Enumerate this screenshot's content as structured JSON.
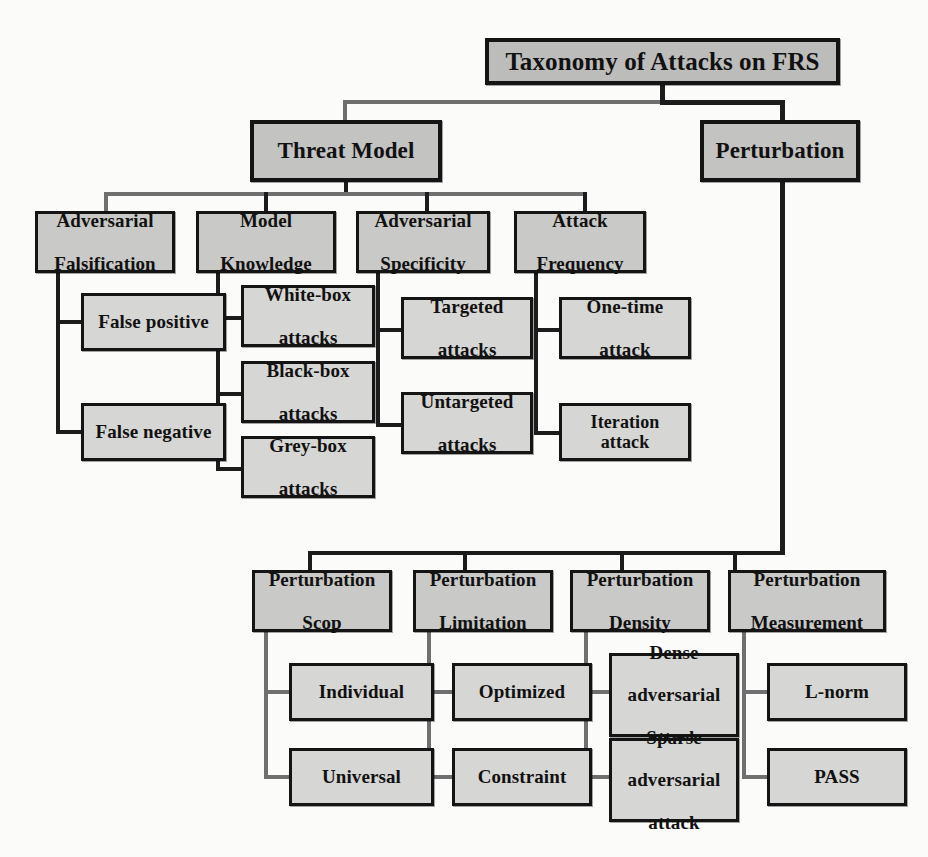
{
  "diagram": {
    "title": "Taxonomy of Attacks on FRS",
    "root": {
      "label": "Taxonomy of Attacks on FRS"
    },
    "branches": [
      {
        "label": "Threat Model",
        "categories": [
          {
            "label": "Adversarial Falsification",
            "line1": "Adversarial",
            "line2": "Falsification",
            "items": [
              {
                "label": "False positive"
              },
              {
                "label": "False negative"
              }
            ]
          },
          {
            "label": "Model Knowledge",
            "line1": "Model",
            "line2": "Knowledge",
            "items": [
              {
                "label": "White-box attacks",
                "line1": "White-box",
                "line2": "attacks"
              },
              {
                "label": "Black-box attacks",
                "line1": "Black-box",
                "line2": "attacks"
              },
              {
                "label": "Grey-box attacks",
                "line1": "Grey-box",
                "line2": "attacks"
              }
            ]
          },
          {
            "label": "Adversarial Specificity",
            "line1": "Adversarial",
            "line2": "Specificity",
            "items": [
              {
                "label": "Targeted attacks",
                "line1": "Targeted",
                "line2": "attacks"
              },
              {
                "label": "Untargeted attacks",
                "line1": "Untargeted",
                "line2": "attacks"
              }
            ]
          },
          {
            "label": "Attack Frequency",
            "line1": "Attack",
            "line2": "Frequency",
            "items": [
              {
                "label": "One-time attack",
                "line1": "One-time",
                "line2": "attack"
              },
              {
                "label": "Iteration attack",
                "line1": "Iteration attack",
                "line2": ""
              }
            ]
          }
        ]
      },
      {
        "label": "Perturbation",
        "categories": [
          {
            "label": "Perturbation Scop",
            "line1": "Perturbation",
            "line2": "Scop",
            "items": [
              {
                "label": "Individual"
              },
              {
                "label": "Universal"
              }
            ]
          },
          {
            "label": "Perturbation Limitation",
            "line1": "Perturbation",
            "line2": "Limitation",
            "items": [
              {
                "label": "Optimized"
              },
              {
                "label": "Constraint"
              }
            ]
          },
          {
            "label": "Perturbation Density",
            "line1": "Perturbation",
            "line2": "Density",
            "items": [
              {
                "label": "Dense adversarial attack",
                "line1": "Dense",
                "line2": "adversarial",
                "line3": "attack"
              },
              {
                "label": "Sparse adversarial attack",
                "line1": "Sparse",
                "line2": "adversarial",
                "line3": "attack"
              }
            ]
          },
          {
            "label": "Perturbation Measurement",
            "line1": "Perturbation",
            "line2": "Measurement",
            "items": [
              {
                "label": "L-norm"
              },
              {
                "label": "PASS"
              }
            ]
          }
        ]
      }
    ],
    "colors": {
      "box_fill_level0": "#bcbcba",
      "box_fill_level1": "#c3c3c1",
      "box_fill_level2": "#c9c9c7",
      "box_fill_level3": "#d6d6d4",
      "box_border": "#141414",
      "connector": "#6f6f6f",
      "background": "#fbfbfa",
      "text": "#111111"
    }
  }
}
